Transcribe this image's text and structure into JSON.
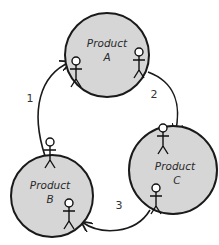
{
  "diagram": {
    "nodes": [
      {
        "id": "A",
        "line1": "Product",
        "line2": "A"
      },
      {
        "id": "B",
        "line1": "Product",
        "line2": "B"
      },
      {
        "id": "C",
        "line1": "Product",
        "line2": "C"
      }
    ],
    "edges": [
      {
        "from": "B",
        "to": "A",
        "label": "1"
      },
      {
        "from": "A",
        "to": "C",
        "label": "2"
      },
      {
        "from": "C",
        "to": "B",
        "label": "3"
      }
    ],
    "colors": {
      "node_fill": "#d6d6d6",
      "stroke": "#1a1a1a",
      "background": "#ffffff"
    }
  }
}
